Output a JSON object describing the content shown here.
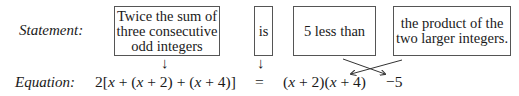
{
  "labels": {
    "statement": "Statement:",
    "equation": "Equation:"
  },
  "statement_boxes": [
    {
      "text": "Twice the sum of three consecutive odd integers",
      "lines": [
        "Twice the sum of",
        "three consecutive",
        "odd integers"
      ]
    },
    {
      "text": "is",
      "lines": [
        "is"
      ]
    },
    {
      "text": "5 less than",
      "lines": [
        "5 less than"
      ]
    },
    {
      "text": "the product of the two larger integers.",
      "lines": [
        "the product of the",
        "two larger integers."
      ]
    }
  ],
  "equation_parts": [
    {
      "text": "2[x + (x + 2) + (x + 4)]"
    },
    {
      "text": "="
    },
    {
      "text": "(x + 2)(x + 4)"
    },
    {
      "text": "−5"
    }
  ],
  "arrows": {
    "down": "↓",
    "crossed": "crossed arrows swapping '5 less than' and 'product' positions"
  }
}
